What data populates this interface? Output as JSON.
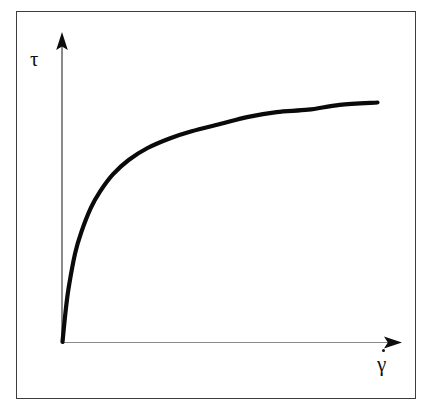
{
  "figure": {
    "kind": "flow-curve-diagram",
    "caption": "",
    "frame": {
      "border_color": "#3d3d3d",
      "background_color": "#ffffff"
    }
  },
  "axes": {
    "y": {
      "label": "τ",
      "label_name": "shear-stress",
      "arrow": "up",
      "line_color": "#8a8a8a",
      "arrow_color": "#0d0d0d"
    },
    "x": {
      "label": "γ",
      "label_accent": "dot",
      "label_name": "shear-rate",
      "arrow": "right",
      "line_color": "#8a8a8a",
      "arrow_color": "#0d0d0d"
    }
  },
  "curve": {
    "name": "shear-thinning-flow-curve",
    "color": "#0a0a0a",
    "stroke_width": 4.2
  },
  "chart_data": {
    "type": "line",
    "title": "",
    "xlabel": "γ̇",
    "ylabel": "τ",
    "grid": false,
    "legend": null,
    "xlim": [
      0,
      1
    ],
    "ylim": [
      0,
      1
    ],
    "axis_ticks": {
      "x": [],
      "y": []
    },
    "annotations": [],
    "series": [
      {
        "name": "shear stress vs shear rate",
        "description": "Shear-thinning (pseudoplastic) flow curve rising steeply from the origin and approaching a plateau.",
        "x": [
          0.0,
          0.01,
          0.02,
          0.04,
          0.06,
          0.09,
          0.12,
          0.16,
          0.21,
          0.27,
          0.34,
          0.41,
          0.5,
          0.59,
          0.68,
          0.78,
          0.88,
          1.0
        ],
        "y": [
          0.0,
          0.13,
          0.23,
          0.37,
          0.46,
          0.56,
          0.63,
          0.7,
          0.76,
          0.81,
          0.85,
          0.88,
          0.91,
          0.94,
          0.96,
          0.97,
          0.99,
          1.0
        ]
      }
    ]
  }
}
